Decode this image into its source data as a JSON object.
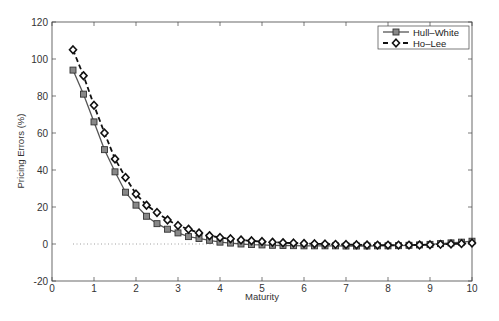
{
  "chart_data": {
    "type": "line",
    "title": "",
    "xlabel": "Maturity",
    "ylabel": "Pricing Errors (%)",
    "xlim": [
      0,
      10
    ],
    "ylim": [
      -20,
      120
    ],
    "xticks": [
      0,
      1,
      2,
      3,
      4,
      5,
      6,
      7,
      8,
      9,
      10
    ],
    "yticks": [
      -20,
      0,
      20,
      40,
      60,
      80,
      100,
      120
    ],
    "grid": false,
    "legend_position": "upper right",
    "x": [
      0.5,
      0.75,
      1.0,
      1.25,
      1.5,
      1.75,
      2.0,
      2.25,
      2.5,
      2.75,
      3.0,
      3.25,
      3.5,
      3.75,
      4.0,
      4.25,
      4.5,
      4.75,
      5.0,
      5.25,
      5.5,
      5.75,
      6.0,
      6.25,
      6.5,
      6.75,
      7.0,
      7.25,
      7.5,
      7.75,
      8.0,
      8.25,
      8.5,
      8.75,
      9.0,
      9.25,
      9.5,
      9.75,
      10.0
    ],
    "series": [
      {
        "name": "Hull-White",
        "style": "solid",
        "marker": "square",
        "color": "#555555",
        "values": [
          94,
          81,
          66,
          51,
          39,
          28,
          21,
          15,
          11,
          8,
          6,
          4,
          3,
          2,
          1,
          0.5,
          0,
          -0.3,
          -0.5,
          -0.7,
          -0.8,
          -0.9,
          -1,
          -1,
          -1,
          -1,
          -1.1,
          -1.1,
          -1.1,
          -1,
          -1,
          -0.9,
          -0.7,
          -0.5,
          -0.2,
          0.2,
          0.6,
          1.0,
          1.5
        ]
      },
      {
        "name": "Ho-Lee",
        "style": "dashed",
        "marker": "diamond",
        "color": "#111111",
        "values": [
          105,
          91,
          75,
          60,
          46,
          36,
          27,
          21,
          17,
          13,
          10,
          8,
          6,
          4.5,
          3.5,
          2.8,
          2.2,
          1.7,
          1.3,
          1,
          0.7,
          0.5,
          0.3,
          0.1,
          0,
          -0.2,
          -0.3,
          -0.4,
          -0.5,
          -0.6,
          -0.6,
          -0.6,
          -0.6,
          -0.5,
          -0.4,
          -0.2,
          0,
          0.2,
          0.5
        ]
      }
    ],
    "reference_line": {
      "y": 0,
      "x_range": [
        0.5,
        4.0
      ],
      "style": "dotted"
    }
  }
}
